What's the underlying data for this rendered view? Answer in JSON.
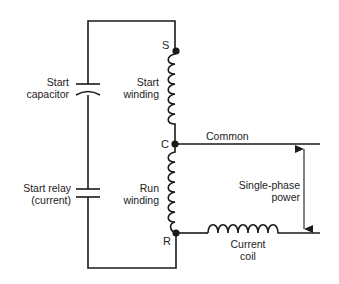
{
  "diagram": {
    "type": "circuit-schematic",
    "terminals": {
      "start": "S",
      "common": "C",
      "run": "R"
    },
    "labels": {
      "start_capacitor_line1": "Start",
      "start_capacitor_line2": "capacitor",
      "start_winding_line1": "Start",
      "start_winding_line2": "winding",
      "start_relay_line1": "Start relay",
      "start_relay_line2": "(current)",
      "run_winding_line1": "Run",
      "run_winding_line2": "winding",
      "common": "Common",
      "power_line1": "Single-phase",
      "power_line2": "power",
      "current_coil_line1": "Current",
      "current_coil_line2": "coil"
    },
    "components": [
      {
        "name": "Start capacitor",
        "symbol": "capacitor"
      },
      {
        "name": "Start relay (current)",
        "symbol": "normally-open contacts"
      },
      {
        "name": "Start winding",
        "symbol": "inductor",
        "between": [
          "S",
          "C"
        ]
      },
      {
        "name": "Run winding",
        "symbol": "inductor",
        "between": [
          "C",
          "R"
        ]
      },
      {
        "name": "Current coil",
        "symbol": "inductor",
        "on_line": "R"
      }
    ],
    "colors": {
      "line": "#1a1a1a",
      "text": "#222222",
      "background": "#ffffff"
    }
  }
}
